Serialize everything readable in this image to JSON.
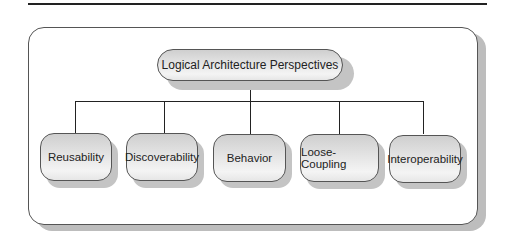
{
  "diagram": {
    "type": "hierarchy",
    "root": {
      "label": "Logical Architecture Perspectives"
    },
    "children": [
      {
        "label": "Reusability"
      },
      {
        "label": "Discoverability"
      },
      {
        "label": "Behavior"
      },
      {
        "label": "Loose-Coupling"
      },
      {
        "label": "Interoperability"
      }
    ],
    "colors": {
      "line": "#222222",
      "node_border": "#555555",
      "node_fill": "#e4e4e4",
      "shadow": "#c4c4c4"
    }
  }
}
